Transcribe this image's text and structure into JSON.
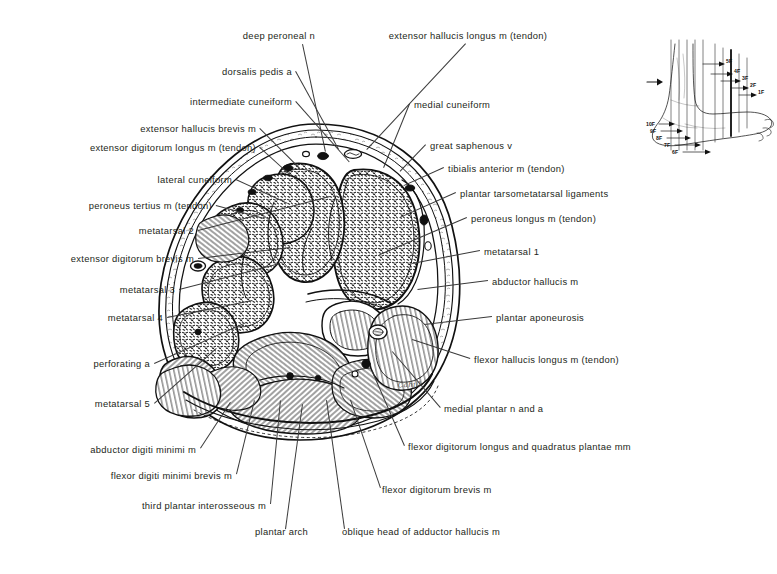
{
  "figure": {
    "artist_signature": "Cahill",
    "background_color": "#ffffff",
    "ink_color": "#231f20",
    "leader_color": "#3a3a3a"
  },
  "labels": {
    "top": [
      {
        "id": "deep-peroneal-n",
        "text": "deep peroneal n",
        "x": 279,
        "y": 38,
        "align": "center",
        "leader": {
          "x1": 303,
          "y1": 44,
          "x2": 326,
          "y2": 152
        }
      },
      {
        "id": "extensor-hallucis-longus-tendon",
        "text": "extensor hallucis longus m (tendon)",
        "x": 468,
        "y": 38,
        "align": "center",
        "leader": {
          "x1": 466,
          "y1": 44,
          "x2": 367,
          "y2": 150
        }
      }
    ],
    "left": [
      {
        "id": "dorsalis-pedis-a",
        "text": "dorsalis pedis a",
        "x": 292,
        "y": 74,
        "align": "right",
        "leader": {
          "x1": 296,
          "y1": 71,
          "x2": 339,
          "y2": 149
        }
      },
      {
        "id": "intermediate-cuneiform",
        "text": "intermediate cuneiform",
        "x": 292,
        "y": 104,
        "align": "right",
        "leader": {
          "x1": 296,
          "y1": 101,
          "x2": 350,
          "y2": 162
        }
      },
      {
        "id": "extensor-hallucis-brevis-m",
        "text": "extensor hallucis brevis m",
        "x": 256,
        "y": 131,
        "align": "right",
        "leader": {
          "x1": 260,
          "y1": 128,
          "x2": 300,
          "y2": 168
        }
      },
      {
        "id": "extensor-digitorum-longus-tendon",
        "text": "extensor digitorum longus m (tendon)",
        "x": 256,
        "y": 150,
        "align": "right",
        "leader": {
          "x1": 260,
          "y1": 147,
          "x2": 292,
          "y2": 176
        }
      },
      {
        "id": "lateral-cuneiform",
        "text": "lateral cuneiform",
        "x": 232,
        "y": 182,
        "align": "right",
        "leader": {
          "x1": 236,
          "y1": 179,
          "x2": 288,
          "y2": 203
        }
      },
      {
        "id": "peroneus-tertius-tendon",
        "text": "peroneus tertius m (tendon)",
        "x": 212,
        "y": 208,
        "align": "right",
        "leader": {
          "x1": 216,
          "y1": 205,
          "x2": 264,
          "y2": 218
        }
      },
      {
        "id": "metatarsal-2",
        "text": "metatarsal 2",
        "x": 194,
        "y": 233,
        "align": "right",
        "leader": {
          "x1": 198,
          "y1": 230,
          "x2": 330,
          "y2": 196
        }
      },
      {
        "id": "extensor-digitorum-brevis-m",
        "text": "extensor digitorum brevis m",
        "x": 194,
        "y": 261,
        "align": "right",
        "leader": {
          "x1": 198,
          "y1": 258,
          "x2": 290,
          "y2": 247
        }
      },
      {
        "id": "metatarsal-3",
        "text": "metatarsal 3",
        "x": 175,
        "y": 292,
        "align": "right",
        "leader": {
          "x1": 179,
          "y1": 289,
          "x2": 280,
          "y2": 263
        }
      },
      {
        "id": "metatarsal-4",
        "text": "metatarsal 4",
        "x": 163,
        "y": 320,
        "align": "right",
        "leader": {
          "x1": 167,
          "y1": 317,
          "x2": 252,
          "y2": 300
        }
      },
      {
        "id": "perforating-a",
        "text": "perforating a",
        "x": 150,
        "y": 366,
        "align": "right",
        "leader": {
          "x1": 154,
          "y1": 363,
          "x2": 246,
          "y2": 322
        }
      },
      {
        "id": "metatarsal-5",
        "text": "metatarsal 5",
        "x": 150,
        "y": 406,
        "align": "right",
        "leader": {
          "x1": 154,
          "y1": 403,
          "x2": 216,
          "y2": 348
        }
      }
    ],
    "right": [
      {
        "id": "medial-cuneiform",
        "text": "medial cuneiform",
        "x": 414,
        "y": 107,
        "align": "left",
        "leader": {
          "x1": 410,
          "y1": 104,
          "x2": 384,
          "y2": 168
        }
      },
      {
        "id": "great-saphenous-v",
        "text": "great saphenous v",
        "x": 430,
        "y": 148,
        "align": "left",
        "leader": {
          "x1": 426,
          "y1": 145,
          "x2": 400,
          "y2": 172
        }
      },
      {
        "id": "tibialis-anterior-tendon",
        "text": "tibialis anterior m (tendon)",
        "x": 448,
        "y": 171,
        "align": "left",
        "leader": {
          "x1": 444,
          "y1": 168,
          "x2": 404,
          "y2": 186
        }
      },
      {
        "id": "plantar-tarsometatarsal-ligaments",
        "text": "plantar tarsometatarsal ligaments",
        "x": 460,
        "y": 196,
        "align": "left",
        "leader": {
          "x1": 456,
          "y1": 193,
          "x2": 400,
          "y2": 218
        }
      },
      {
        "id": "peroneus-longus-tendon",
        "text": "peroneus longus m (tendon)",
        "x": 471,
        "y": 221,
        "align": "left",
        "leader": {
          "x1": 467,
          "y1": 218,
          "x2": 380,
          "y2": 255
        }
      },
      {
        "id": "metatarsal-1",
        "text": "metatarsal 1",
        "x": 484,
        "y": 254,
        "align": "left",
        "leader": {
          "x1": 480,
          "y1": 251,
          "x2": 412,
          "y2": 264
        }
      },
      {
        "id": "abductor-hallucis-m",
        "text": "abductor hallucis m",
        "x": 492,
        "y": 284,
        "align": "left",
        "leader": {
          "x1": 488,
          "y1": 281,
          "x2": 418,
          "y2": 290
        }
      },
      {
        "id": "plantar-aponeurosis",
        "text": "plantar aponeurosis",
        "x": 496,
        "y": 320,
        "align": "left",
        "leader": {
          "x1": 492,
          "y1": 317,
          "x2": 424,
          "y2": 325
        }
      },
      {
        "id": "flexor-hallucis-longus-tendon",
        "text": "flexor hallucis longus m (tendon)",
        "x": 474,
        "y": 362,
        "align": "left",
        "leader": {
          "x1": 470,
          "y1": 359,
          "x2": 412,
          "y2": 340
        }
      },
      {
        "id": "medial-plantar-n-and-a",
        "text": "medial plantar n and a",
        "x": 444,
        "y": 411,
        "align": "left",
        "leader": {
          "x1": 440,
          "y1": 408,
          "x2": 392,
          "y2": 352
        }
      },
      {
        "id": "flexor-digitorum-longus-quadratus",
        "text": "flexor digitorum longus and quadratus plantae mm",
        "x": 408,
        "y": 449,
        "align": "left",
        "leader": {
          "x1": 404,
          "y1": 446,
          "x2": 372,
          "y2": 372
        }
      }
    ],
    "bottom": [
      {
        "id": "abductor-digiti-minimi-m",
        "text": "abductor digiti minimi m",
        "x": 196,
        "y": 452,
        "align": "right",
        "leader": {
          "x1": 200,
          "y1": 448,
          "x2": 230,
          "y2": 402
        }
      },
      {
        "id": "flexor-digiti-minimi-brevis-m",
        "text": "flexor digiti minimi brevis m",
        "x": 232,
        "y": 478,
        "align": "right",
        "leader": {
          "x1": 236,
          "y1": 474,
          "x2": 254,
          "y2": 400
        }
      },
      {
        "id": "third-plantar-interosseous-m",
        "text": "third plantar interosseous m",
        "x": 266,
        "y": 508,
        "align": "right",
        "leader": {
          "x1": 270,
          "y1": 504,
          "x2": 280,
          "y2": 400
        }
      },
      {
        "id": "plantar-arch",
        "text": "plantar arch",
        "x": 255,
        "y": 534,
        "align": "left",
        "leader": {
          "x1": 285,
          "y1": 529,
          "x2": 302,
          "y2": 404
        }
      },
      {
        "id": "oblique-head-adductor-hallucis",
        "text": "oblique head of adductor hallucis m",
        "x": 342,
        "y": 534,
        "align": "left",
        "leader": {
          "x1": 344,
          "y1": 529,
          "x2": 326,
          "y2": 400
        }
      },
      {
        "id": "flexor-digitorum-brevis-m",
        "text": "flexor digitorum brevis m",
        "x": 382,
        "y": 492,
        "align": "left",
        "leader": {
          "x1": 380,
          "y1": 488,
          "x2": 350,
          "y2": 400
        }
      }
    ]
  },
  "key_inset": {
    "id": "section-level-key",
    "description": "lateral view of foot with transverse section level markers",
    "arrow_marker": "▶",
    "levels_upper": [
      "5F",
      "4F",
      "3F",
      "2F",
      "1F"
    ],
    "levels_lower": [
      "10F",
      "9F",
      "8F",
      "7F",
      "6F"
    ],
    "current_level": "3F"
  }
}
